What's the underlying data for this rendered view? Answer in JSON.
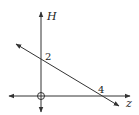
{
  "diagram": {
    "axes": {
      "vertical_label": "H",
      "horizontal_label": "z"
    },
    "line": {
      "h_intercept_label": "2",
      "z_intercept_label": "4"
    },
    "origin_marker": "open-circle",
    "colors": {
      "stroke": "#333333",
      "background": "#ffffff"
    }
  }
}
